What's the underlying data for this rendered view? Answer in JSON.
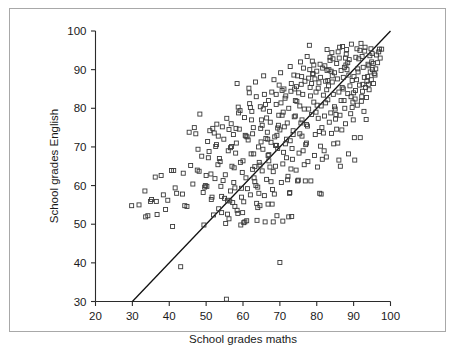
{
  "figure": {
    "background_color": "#ffffff",
    "border_color": "#a8a8a8",
    "marker_color": "#3a3a3a",
    "line_color": "#111111",
    "axis_color": "#2b2b2b"
  },
  "chart_data": {
    "type": "scatter",
    "title": "",
    "xlabel": "School grades maths",
    "ylabel": "School grades English",
    "xlim": [
      20,
      100
    ],
    "ylim": [
      30,
      100
    ],
    "xticks": [
      20,
      30,
      40,
      50,
      60,
      70,
      80,
      90,
      100
    ],
    "yticks": [
      30,
      40,
      50,
      60,
      70,
      80,
      90,
      100
    ],
    "xtick_labels": [
      "20",
      "30",
      "40",
      "50",
      "60",
      "70",
      "80",
      "90",
      "100"
    ],
    "ytick_labels": [
      "30",
      "40",
      "50",
      "60",
      "70",
      "80",
      "90",
      "100"
    ],
    "grid": false,
    "legend": null,
    "annotations": [],
    "reference_line": {
      "name": "identity-line",
      "description": "y = x diagonal line",
      "x": [
        20,
        100
      ],
      "y": [
        20,
        100
      ],
      "clipped_at_y": 30
    },
    "marker_style": "open-square",
    "n_points": 452,
    "points": [
      [
        29.8,
        54.8
      ],
      [
        33.4,
        58.6
      ],
      [
        33.6,
        51.9
      ],
      [
        34.9,
        55.9
      ],
      [
        36.2,
        62.2
      ],
      [
        36.5,
        55.9
      ],
      [
        36.7,
        52.5
      ],
      [
        40.6,
        63.9
      ],
      [
        41.2,
        63.9
      ],
      [
        38.4,
        57.6
      ],
      [
        40.9,
        49.4
      ],
      [
        43.1,
        39.0
      ],
      [
        44.8,
        54.6
      ],
      [
        47.2,
        73.4
      ],
      [
        48.1,
        63.7
      ],
      [
        48.3,
        78.5
      ],
      [
        49.4,
        49.8
      ],
      [
        49.6,
        59.6
      ],
      [
        50.2,
        59.8
      ],
      [
        50.6,
        67.2
      ],
      [
        51.3,
        63.0
      ],
      [
        51.8,
        74.8
      ],
      [
        52.6,
        70.1
      ],
      [
        52.9,
        75.9
      ],
      [
        53.3,
        72.8
      ],
      [
        53.8,
        66.2
      ],
      [
        54.2,
        57.2
      ],
      [
        54.6,
        61.3
      ],
      [
        55.0,
        56.7
      ],
      [
        55.3,
        50.2
      ],
      [
        55.5,
        30.6
      ],
      [
        55.8,
        52.6
      ],
      [
        56.2,
        74.5
      ],
      [
        56.6,
        69.8
      ],
      [
        56.9,
        70.1
      ],
      [
        57.2,
        55.6
      ],
      [
        57.5,
        60.8
      ],
      [
        57.8,
        59.4
      ],
      [
        58.1,
        74.8
      ],
      [
        58.4,
        86.4
      ],
      [
        58.7,
        80.3
      ],
      [
        59.0,
        74.6
      ],
      [
        59.3,
        66.0
      ],
      [
        59.6,
        59.3
      ],
      [
        59.9,
        53.0
      ],
      [
        60.2,
        50.4
      ],
      [
        60.5,
        50.6
      ],
      [
        60.8,
        62.0
      ],
      [
        61.1,
        72.6
      ],
      [
        61.4,
        71.8
      ],
      [
        61.7,
        84.0
      ],
      [
        62.0,
        80.2
      ],
      [
        62.3,
        77.0
      ],
      [
        62.6,
        73.4
      ],
      [
        62.9,
        68.2
      ],
      [
        63.2,
        64.9
      ],
      [
        63.5,
        60.0
      ],
      [
        63.7,
        55.4
      ],
      [
        64.0,
        54.3
      ],
      [
        64.3,
        58.0
      ],
      [
        64.6,
        65.3
      ],
      [
        64.9,
        71.3
      ],
      [
        65.2,
        75.6
      ],
      [
        65.5,
        79.8
      ],
      [
        65.8,
        83.6
      ],
      [
        66.1,
        81.0
      ],
      [
        66.4,
        77.5
      ],
      [
        66.7,
        72.0
      ],
      [
        67.0,
        68.0
      ],
      [
        67.3,
        64.8
      ],
      [
        67.6,
        61.0
      ],
      [
        67.9,
        55.2
      ],
      [
        68.2,
        50.6
      ],
      [
        68.5,
        57.8
      ],
      [
        68.8,
        65.0
      ],
      [
        69.1,
        70.4
      ],
      [
        69.4,
        74.9
      ],
      [
        69.7,
        78.2
      ],
      [
        70.0,
        40.1
      ],
      [
        70.3,
        81.4
      ],
      [
        70.6,
        84.6
      ],
      [
        70.9,
        79.0
      ],
      [
        71.2,
        75.2
      ],
      [
        71.5,
        70.8
      ],
      [
        71.8,
        67.2
      ],
      [
        72.1,
        61.5
      ],
      [
        72.4,
        51.9
      ],
      [
        72.7,
        58.2
      ],
      [
        73.0,
        64.3
      ],
      [
        73.3,
        69.6
      ],
      [
        73.6,
        73.2
      ],
      [
        73.9,
        77.8
      ],
      [
        74.2,
        82.0
      ],
      [
        74.5,
        85.6
      ],
      [
        74.8,
        88.4
      ],
      [
        75.1,
        84.0
      ],
      [
        75.4,
        80.6
      ],
      [
        75.7,
        76.2
      ],
      [
        76.0,
        72.8
      ],
      [
        76.3,
        69.0
      ],
      [
        76.6,
        65.4
      ],
      [
        76.9,
        61.2
      ],
      [
        77.2,
        71.0
      ],
      [
        77.5,
        75.4
      ],
      [
        77.8,
        79.8
      ],
      [
        78.0,
        96.3
      ],
      [
        78.3,
        83.2
      ],
      [
        78.6,
        86.4
      ],
      [
        78.9,
        89.0
      ],
      [
        79.2,
        91.2
      ],
      [
        79.5,
        87.6
      ],
      [
        79.8,
        84.2
      ],
      [
        80.1,
        80.8
      ],
      [
        80.4,
        77.4
      ],
      [
        80.7,
        74.0
      ],
      [
        81.0,
        70.2
      ],
      [
        81.2,
        57.8
      ],
      [
        81.5,
        66.8
      ],
      [
        81.8,
        73.6
      ],
      [
        82.1,
        78.0
      ],
      [
        82.4,
        81.4
      ],
      [
        82.7,
        84.8
      ],
      [
        83.0,
        87.2
      ],
      [
        83.3,
        90.0
      ],
      [
        83.6,
        92.4
      ],
      [
        83.9,
        89.6
      ],
      [
        84.2,
        86.8
      ],
      [
        84.5,
        83.6
      ],
      [
        84.8,
        80.4
      ],
      [
        85.1,
        77.2
      ],
      [
        85.4,
        74.6
      ],
      [
        85.7,
        71.0
      ],
      [
        86.0,
        66.6
      ],
      [
        86.3,
        78.2
      ],
      [
        86.6,
        82.0
      ],
      [
        86.9,
        85.4
      ],
      [
        87.2,
        88.0
      ],
      [
        87.5,
        90.6
      ],
      [
        87.8,
        93.0
      ],
      [
        88.1,
        95.2
      ],
      [
        88.4,
        91.8
      ],
      [
        88.7,
        88.6
      ],
      [
        89.0,
        85.8
      ],
      [
        89.3,
        83.0
      ],
      [
        89.6,
        80.2
      ],
      [
        89.9,
        77.0
      ],
      [
        90.2,
        72.4
      ],
      [
        90.5,
        84.6
      ],
      [
        90.8,
        87.4
      ],
      [
        91.1,
        90.2
      ],
      [
        91.4,
        92.8
      ],
      [
        91.7,
        95.0
      ],
      [
        92.0,
        96.8
      ],
      [
        92.3,
        93.4
      ],
      [
        92.6,
        90.6
      ],
      [
        92.9,
        88.0
      ],
      [
        93.2,
        85.4
      ],
      [
        93.5,
        82.8
      ],
      [
        93.8,
        88.2
      ],
      [
        94.1,
        91.0
      ],
      [
        94.4,
        93.6
      ],
      [
        94.7,
        95.4
      ],
      [
        95.0,
        94.2
      ],
      [
        95.3,
        91.6
      ],
      [
        95.6,
        89.0
      ],
      [
        96.2,
        93.8
      ],
      [
        97.0,
        95.3
      ],
      [
        97.6,
        95.3
      ],
      [
        93.4,
        77.1
      ],
      [
        91.8,
        72.4
      ],
      [
        90.3,
        66.6
      ],
      [
        88.6,
        68.2
      ],
      [
        86.4,
        65.0
      ],
      [
        84.0,
        73.5
      ],
      [
        82.0,
        69.0
      ],
      [
        80.2,
        64.8
      ],
      [
        78.4,
        61.2
      ],
      [
        75.0,
        61.4
      ],
      [
        73.2,
        52.0
      ],
      [
        70.8,
        50.8
      ],
      [
        69.2,
        52.2
      ],
      [
        66.0,
        50.6
      ],
      [
        63.8,
        51.0
      ],
      [
        61.0,
        50.9
      ],
      [
        58.6,
        52.8
      ],
      [
        56.4,
        56.0
      ],
      [
        54.0,
        59.8
      ],
      [
        51.6,
        57.0
      ],
      [
        49.8,
        60.0
      ],
      [
        47.6,
        64.0
      ],
      [
        45.4,
        73.8
      ],
      [
        43.6,
        57.8
      ],
      [
        59.4,
        49.8
      ],
      [
        64.6,
        54.8
      ],
      [
        66.8,
        55.2
      ],
      [
        72.6,
        58.0
      ],
      [
        74.8,
        61.2
      ],
      [
        80.8,
        58.0
      ],
      [
        84.4,
        92.8
      ],
      [
        85.8,
        94.6
      ],
      [
        87.0,
        96.0
      ],
      [
        89.4,
        96.6
      ],
      [
        81.6,
        90.4
      ],
      [
        79.0,
        88.8
      ],
      [
        76.8,
        87.0
      ],
      [
        74.0,
        85.0
      ],
      [
        71.6,
        83.2
      ],
      [
        69.0,
        81.0
      ],
      [
        67.2,
        79.2
      ],
      [
        65.0,
        77.0
      ],
      [
        62.8,
        75.0
      ],
      [
        60.6,
        73.0
      ],
      [
        58.2,
        71.0
      ],
      [
        56.0,
        69.0
      ],
      [
        53.6,
        67.0
      ],
      [
        68.4,
        87.4
      ],
      [
        70.2,
        89.2
      ],
      [
        72.8,
        90.8
      ],
      [
        75.6,
        92.0
      ],
      [
        77.4,
        93.4
      ],
      [
        82.8,
        95.2
      ],
      [
        86.2,
        95.8
      ],
      [
        88.0,
        94.0
      ],
      [
        90.6,
        93.2
      ],
      [
        93.0,
        94.8
      ],
      [
        94.9,
        92.0
      ],
      [
        95.8,
        88.6
      ],
      [
        92.5,
        86.2
      ],
      [
        90.0,
        84.0
      ],
      [
        87.4,
        82.0
      ],
      [
        85.0,
        79.8
      ],
      [
        83.4,
        76.4
      ],
      [
        81.4,
        75.0
      ],
      [
        79.6,
        73.2
      ],
      [
        77.0,
        70.6
      ],
      [
        75.2,
        68.4
      ],
      [
        73.4,
        66.8
      ],
      [
        71.0,
        68.6
      ],
      [
        68.8,
        70.4
      ],
      [
        66.2,
        72.2
      ],
      [
        64.2,
        70.0
      ],
      [
        62.2,
        68.2
      ],
      [
        60.0,
        66.4
      ],
      [
        57.6,
        64.6
      ],
      [
        55.2,
        62.8
      ],
      [
        52.8,
        70.6
      ],
      [
        50.8,
        68.8
      ],
      [
        61.6,
        85.2
      ],
      [
        63.4,
        86.8
      ],
      [
        65.6,
        88.4
      ],
      [
        67.8,
        84.2
      ],
      [
        69.8,
        86.0
      ],
      [
        73.8,
        88.6
      ],
      [
        76.4,
        90.4
      ],
      [
        78.8,
        92.2
      ],
      [
        80.6,
        86.6
      ],
      [
        83.8,
        78.8
      ],
      [
        86.8,
        74.4
      ],
      [
        84.6,
        70.8
      ],
      [
        82.6,
        67.4
      ],
      [
        79.4,
        67.8
      ],
      [
        77.6,
        66.2
      ],
      [
        74.4,
        64.0
      ],
      [
        72.2,
        62.4
      ],
      [
        70.4,
        60.8
      ],
      [
        68.0,
        59.0
      ],
      [
        65.8,
        57.4
      ],
      [
        63.0,
        62.0
      ],
      [
        59.8,
        63.4
      ],
      [
        57.0,
        65.0
      ],
      [
        54.8,
        72.0
      ],
      [
        52.2,
        73.6
      ],
      [
        50.4,
        71.4
      ],
      [
        86.6,
        89.8
      ],
      [
        88.8,
        92.6
      ],
      [
        91.2,
        89.4
      ],
      [
        93.6,
        87.0
      ],
      [
        95.4,
        86.4
      ],
      [
        94.2,
        84.8
      ],
      [
        92.2,
        83.0
      ],
      [
        89.8,
        81.6
      ],
      [
        87.6,
        80.0
      ],
      [
        85.2,
        78.4
      ],
      [
        83.2,
        85.8
      ],
      [
        81.0,
        88.0
      ],
      [
        78.2,
        85.4
      ],
      [
        76.2,
        83.6
      ],
      [
        74.6,
        81.8
      ],
      [
        72.4,
        80.0
      ],
      [
        70.6,
        78.2
      ],
      [
        67.4,
        76.4
      ],
      [
        64.8,
        74.8
      ],
      [
        62.4,
        79.2
      ],
      [
        60.4,
        77.6
      ],
      [
        58.8,
        78.8
      ],
      [
        56.8,
        76.0
      ],
      [
        91.6,
        86.0
      ],
      [
        93.9,
        91.4
      ],
      [
        95.1,
        90.0
      ],
      [
        96.5,
        91.8
      ],
      [
        89.2,
        78.6
      ],
      [
        87.8,
        76.0
      ],
      [
        85.6,
        87.6
      ],
      [
        84.8,
        89.2
      ],
      [
        82.2,
        91.0
      ],
      [
        80.0,
        89.6
      ],
      [
        77.8,
        87.8
      ],
      [
        75.8,
        86.2
      ],
      [
        73.0,
        84.4
      ],
      [
        71.4,
        82.6
      ],
      [
        69.6,
        75.6
      ],
      [
        66.6,
        73.8
      ],
      [
        69.2,
        73.0
      ],
      [
        67.6,
        71.2
      ],
      [
        65.4,
        69.4
      ],
      [
        63.6,
        83.0
      ],
      [
        61.8,
        81.2
      ],
      [
        59.2,
        79.4
      ],
      [
        57.4,
        73.2
      ],
      [
        55.6,
        77.4
      ],
      [
        53.2,
        65.4
      ],
      [
        51.0,
        74.2
      ],
      [
        48.8,
        67.6
      ],
      [
        46.8,
        75.0
      ],
      [
        44.2,
        54.8
      ],
      [
        42.0,
        58.0
      ],
      [
        39.6,
        56.2
      ],
      [
        37.8,
        62.6
      ],
      [
        35.2,
        56.4
      ],
      [
        34.2,
        52.2
      ],
      [
        31.8,
        55.0
      ],
      [
        91.0,
        80.8
      ],
      [
        92.8,
        79.2
      ],
      [
        94.5,
        89.4
      ],
      [
        96.8,
        94.6
      ],
      [
        90.9,
        95.4
      ],
      [
        88.2,
        90.0
      ],
      [
        85.4,
        91.6
      ],
      [
        83.6,
        93.2
      ],
      [
        81.8,
        83.4
      ],
      [
        79.2,
        81.6
      ],
      [
        76.6,
        79.8
      ],
      [
        74.2,
        78.0
      ],
      [
        72.0,
        76.2
      ],
      [
        70.0,
        74.4
      ],
      [
        68.6,
        72.6
      ],
      [
        66.8,
        67.8
      ],
      [
        64.4,
        66.0
      ],
      [
        62.6,
        64.2
      ],
      [
        60.8,
        72.8
      ],
      [
        58.0,
        68.4
      ],
      [
        56.6,
        58.6
      ],
      [
        54.4,
        75.2
      ],
      [
        52.4,
        61.8
      ],
      [
        50.0,
        62.6
      ],
      [
        47.8,
        69.4
      ],
      [
        45.8,
        65.2
      ],
      [
        43.8,
        63.2
      ],
      [
        41.6,
        59.4
      ],
      [
        39.0,
        53.8
      ],
      [
        93.1,
        95.8
      ],
      [
        94.8,
        87.4
      ],
      [
        96.0,
        90.2
      ],
      [
        97.2,
        93.0
      ],
      [
        89.6,
        87.2
      ],
      [
        87.2,
        85.0
      ],
      [
        84.2,
        88.4
      ],
      [
        82.4,
        87.0
      ],
      [
        80.4,
        85.2
      ],
      [
        78.6,
        78.4
      ],
      [
        76.0,
        77.0
      ],
      [
        73.6,
        74.2
      ],
      [
        71.8,
        72.0
      ],
      [
        69.4,
        69.6
      ],
      [
        67.0,
        66.4
      ],
      [
        65.2,
        63.8
      ],
      [
        63.2,
        61.0
      ],
      [
        61.2,
        59.2
      ],
      [
        59.6,
        57.0
      ],
      [
        57.8,
        54.6
      ],
      [
        55.8,
        56.2
      ],
      [
        53.4,
        54.0
      ],
      [
        51.4,
        56.4
      ],
      [
        49.2,
        58.2
      ],
      [
        46.4,
        60.4
      ],
      [
        92.1,
        81.8
      ],
      [
        90.4,
        82.4
      ],
      [
        88.4,
        83.8
      ],
      [
        86.0,
        84.2
      ],
      [
        83.0,
        82.2
      ],
      [
        81.2,
        80.6
      ],
      [
        79.8,
        79.0
      ],
      [
        77.2,
        75.8
      ],
      [
        75.4,
        73.4
      ],
      [
        72.8,
        71.6
      ],
      [
        70.8,
        65.6
      ],
      [
        68.2,
        63.6
      ],
      [
        66.4,
        61.6
      ],
      [
        64.0,
        59.6
      ],
      [
        62.0,
        57.6
      ],
      [
        60.2,
        55.8
      ],
      [
        58.4,
        53.6
      ],
      [
        56.2,
        51.4
      ],
      [
        54.2,
        53.0
      ],
      [
        52.0,
        52.4
      ],
      [
        94.0,
        86.2
      ],
      [
        92.4,
        84.4
      ],
      [
        90.1,
        88.2
      ],
      [
        87.9,
        91.2
      ],
      [
        86.1,
        93.0
      ],
      [
        84.1,
        94.4
      ],
      [
        82.8,
        89.8
      ],
      [
        80.9,
        91.4
      ],
      [
        78.1,
        90.0
      ],
      [
        75.9,
        88.2
      ],
      [
        73.1,
        86.4
      ],
      [
        71.1,
        85.0
      ],
      [
        69.0,
        83.6
      ],
      [
        66.9,
        82.0
      ],
      [
        64.7,
        80.4
      ]
    ]
  }
}
